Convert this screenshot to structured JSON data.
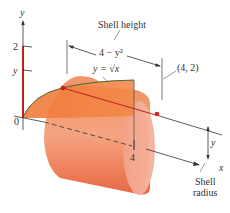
{
  "figure": {
    "axes": {
      "y_axis_label": "y",
      "x_axis_label": "x",
      "origin_label": "0",
      "y_tick_2": "2",
      "y_tick_y": "y",
      "x_tick_4": "4"
    },
    "annotations": {
      "shell_height": "Shell height",
      "height_expr": "4 − y²",
      "curve_label": "y = √x",
      "point_label": "(4, 2)",
      "radius_y": "y",
      "shell_radius_line1": "Shell",
      "shell_radius_line2": "radius"
    },
    "colors": {
      "shell_fill": "#ef7d4a",
      "shell_light": "#f6b79a",
      "region_fill": "#f08040",
      "curve": "#4a6a3a",
      "strip": "#c0201a",
      "dot": "#e0201a",
      "axis": "#333333"
    }
  }
}
